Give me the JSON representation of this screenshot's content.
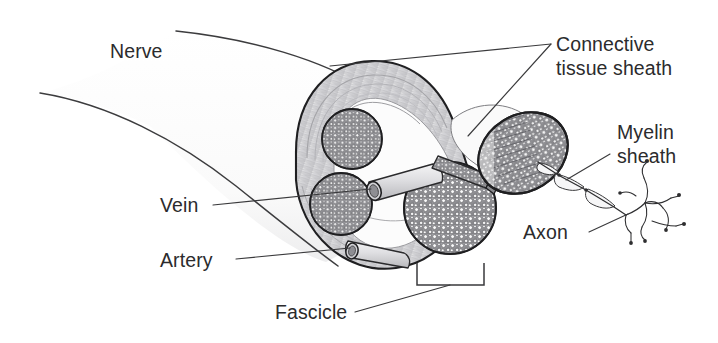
{
  "figure": {
    "width": 718,
    "height": 343,
    "background_color": "#ffffff",
    "line_color": "#3a3a3c",
    "text_color": "#2b2b2d",
    "fascicle_fill": "#8d8d90",
    "sheath_fill": "#d8d8da",
    "vessel_fill": "#cfcfd2"
  },
  "labels": {
    "nerve": "Nerve",
    "connective_tissue_sheath_line1": "Connective",
    "connective_tissue_sheath_line2": "tissue sheath",
    "myelin_sheath_line1": "Myelin",
    "myelin_sheath_line2": "sheath",
    "axon": "Axon",
    "vein": "Vein",
    "artery": "Artery",
    "fascicle": "Fascicle"
  },
  "structures": {
    "fascicle_count_in_section": 3,
    "protruding_fascicle_count": 1,
    "vessel_count": 2,
    "vessels": [
      "vein",
      "artery"
    ]
  }
}
